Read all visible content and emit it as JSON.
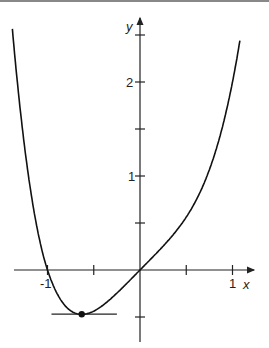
{
  "chart_data": {
    "type": "line",
    "title": "",
    "function": "y = x^4 + x",
    "xlabel": "x",
    "ylabel": "y",
    "xlim": [
      -1.4,
      1.1
    ],
    "ylim": [
      -0.55,
      2.6
    ],
    "x_ticks": [
      -1,
      -0.5,
      0.5,
      1
    ],
    "x_tick_labels": [
      "-1",
      "1"
    ],
    "y_ticks": [
      -0.5,
      0.5,
      1,
      1.5,
      2,
      2.5
    ],
    "y_tick_labels": [
      "1",
      "2"
    ],
    "grid": false,
    "legend": null,
    "series": [
      {
        "name": "f(x)",
        "x": [
          -1.3,
          -1.2,
          -1.1,
          -1.0,
          -0.9,
          -0.8,
          -0.7,
          -0.63,
          -0.5,
          -0.4,
          -0.3,
          -0.2,
          -0.1,
          0,
          0.2,
          0.4,
          0.6,
          0.8,
          1.0,
          1.1
        ],
        "values": [
          1.56,
          0.87,
          0.36,
          0.0,
          -0.24,
          -0.39,
          -0.46,
          -0.47,
          -0.44,
          -0.37,
          -0.29,
          -0.2,
          -0.1,
          0,
          0.2,
          0.43,
          0.73,
          1.21,
          2.0,
          2.56
        ]
      }
    ],
    "annotations": [
      {
        "type": "point",
        "x": -0.63,
        "y": -0.47,
        "label": "minimum"
      },
      {
        "type": "horizontal-tangent",
        "y": -0.47,
        "x_range": [
          -1.0,
          -0.25
        ]
      }
    ]
  },
  "labels": {
    "x_axis": "x",
    "y_axis": "y",
    "tick_neg1": "-1",
    "tick_1": "1",
    "ytick_1": "1",
    "ytick_2": "2"
  }
}
